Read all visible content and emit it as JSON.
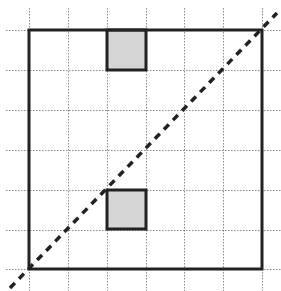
{
  "diagram": {
    "type": "grid-figure",
    "width": 281,
    "height": 291,
    "grid": {
      "x_lines": [
        29,
        68,
        107,
        146,
        184,
        223,
        262
      ],
      "y_lines": [
        30,
        70,
        110,
        150,
        190,
        230,
        269
      ],
      "x_extent": [
        6,
        281
      ],
      "y_extent": [
        8,
        291
      ],
      "color": "#8a8a8a",
      "style": "dotted"
    },
    "square": {
      "x": 29,
      "y": 30,
      "width": 233,
      "height": 239,
      "stroke": "#222222",
      "stroke_width": 3
    },
    "shaded_cells": [
      {
        "name": "top-shaded-cell",
        "x": 107,
        "y": 30,
        "width": 39,
        "height": 40,
        "fill": "#d6d6d6"
      },
      {
        "name": "bottom-shaded-cell",
        "x": 107,
        "y": 190,
        "width": 39,
        "height": 39,
        "fill": "#d6d6d6"
      }
    ],
    "diagonal": {
      "x1": 10,
      "y1": 288,
      "x2": 277,
      "y2": 13,
      "stroke": "#222222",
      "stroke_width": 3.5,
      "dasharray": "7,6",
      "style": "dashed"
    }
  }
}
